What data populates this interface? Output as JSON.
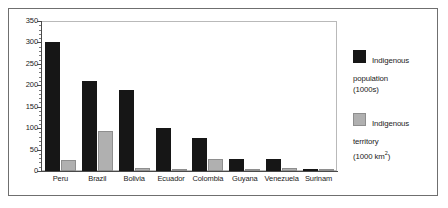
{
  "chart_data": {
    "type": "bar",
    "title": "",
    "subtitle": "",
    "xlabel": "",
    "ylabel": "",
    "ylim": [
      0,
      350
    ],
    "yticks": [
      0,
      50,
      100,
      150,
      200,
      250,
      300,
      350
    ],
    "ytick_labels": [
      "0",
      "50",
      "100",
      "150",
      "200",
      "250",
      "300",
      "350"
    ],
    "grid": false,
    "legend_position": "right",
    "categories": [
      "Peru",
      "Brazil",
      "Bolivia",
      "Ecuador",
      "Colombia",
      "Guyana",
      "Venezuela",
      "Surinam"
    ],
    "series": [
      {
        "name": "Indigenous population (1000s)",
        "color": "#161616",
        "values": [
          300,
          210,
          190,
          100,
          77,
          28,
          27,
          5
        ]
      },
      {
        "name": "Indigenous territory (1000 km2)",
        "color": "#b0b0b0",
        "values": [
          25,
          93,
          7,
          5,
          28,
          1,
          8,
          1
        ]
      }
    ]
  },
  "legend": {
    "entries": [
      {
        "swatch": "black",
        "line1": "Indigenous",
        "line2": "population",
        "line3_prefix": "(1000s)",
        "line3_sup": "",
        "line3_suffix": ""
      },
      {
        "swatch": "gray",
        "line1": "Indigenous",
        "line2": "territory",
        "line3_prefix": "(1000 km",
        "line3_sup": "2",
        "line3_suffix": ")"
      }
    ]
  },
  "axis": {
    "y_tick_labels": [
      "350",
      "300",
      "250",
      "200",
      "150",
      "100",
      "50",
      "0"
    ],
    "x_tick_labels": [
      "Peru",
      "Brazil",
      "Bolivia",
      "Ecuador",
      "Colombia",
      "Guyana",
      "Venezuela",
      "Surinam"
    ]
  }
}
